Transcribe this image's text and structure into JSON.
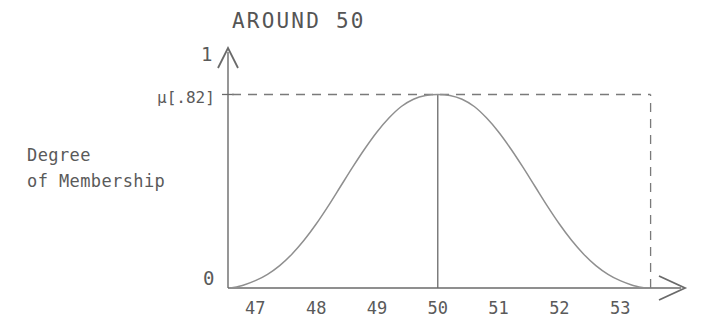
{
  "chart_data": {
    "type": "line",
    "title": "AROUND 50",
    "xlabel": "",
    "ylabel": "Degree\nof Membership",
    "ylabel_line1": "Degree",
    "ylabel_line2": "of Membership",
    "x_tick_labels": [
      "47",
      "48",
      "49",
      "50",
      "51",
      "52",
      "53"
    ],
    "x_tick_values": [
      47,
      48,
      49,
      50,
      51,
      52,
      53
    ],
    "xlim": [
      46.55,
      54.0
    ],
    "ylim": [
      0,
      1
    ],
    "y_tick_labels": [
      "0",
      "1"
    ],
    "y_axis_top_label": "1",
    "y_axis_zero_label": "0",
    "annotation_label": "μ[.82]",
    "annotation_value": 0.82,
    "grid": false,
    "legend": null,
    "series": [
      {
        "name": "around 50 membership",
        "peak_x": 50,
        "peak_y": 0.82,
        "x": [
          46.6,
          46.8,
          47.0,
          47.2,
          47.4,
          47.6,
          47.8,
          48.0,
          48.2,
          48.4,
          48.6,
          48.8,
          49.0,
          49.2,
          49.4,
          49.6,
          49.8,
          50.0,
          50.2,
          50.4,
          50.6,
          50.8,
          51.0,
          51.2,
          51.4,
          51.6,
          51.8,
          52.0,
          52.2,
          52.4,
          52.6,
          52.8,
          53.0,
          53.2,
          53.4
        ],
        "values": [
          0.0,
          0.012,
          0.031,
          0.058,
          0.095,
          0.143,
          0.202,
          0.271,
          0.348,
          0.43,
          0.512,
          0.59,
          0.661,
          0.721,
          0.769,
          0.8,
          0.816,
          0.82,
          0.816,
          0.8,
          0.769,
          0.721,
          0.661,
          0.59,
          0.512,
          0.43,
          0.348,
          0.271,
          0.202,
          0.143,
          0.095,
          0.058,
          0.031,
          0.012,
          0.0
        ]
      }
    ],
    "markers": [
      {
        "name": "peak-vertical-line",
        "x": 50,
        "from_y": 0,
        "to_y": 0.82,
        "style": "solid"
      },
      {
        "name": "mu-horizontal-dashed",
        "y": 0.82,
        "from_x": 46.55,
        "to_x": 53.5,
        "style": "dashed"
      },
      {
        "name": "right-vertical-dashed",
        "x": 53.5,
        "from_y": 0,
        "to_y": 0.82,
        "style": "dashed"
      }
    ],
    "colors": {
      "curve": "#8a8a8a",
      "axis": "#6a6a6a",
      "dashed": "#7a7a7a",
      "text": "#5a5a5a",
      "background": "#ffffff"
    }
  }
}
